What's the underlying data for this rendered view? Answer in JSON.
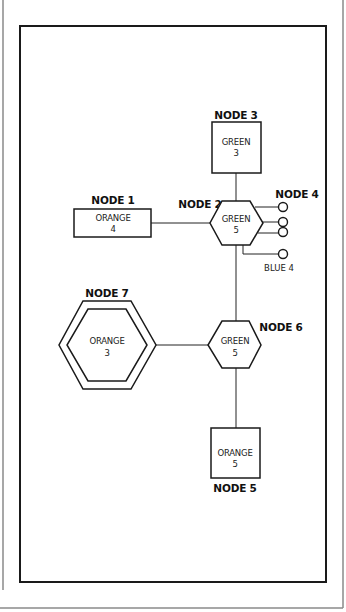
{
  "diagram": {
    "nodes": [
      {
        "id": "node-1",
        "label": "NODE 1",
        "color": "ORANGE",
        "value": "4",
        "shape": "rectangle"
      },
      {
        "id": "node-2",
        "label": "NODE 2",
        "color": "GREEN",
        "value": "5",
        "shape": "hexagon"
      },
      {
        "id": "node-3",
        "label": "NODE 3",
        "color": "GREEN",
        "value": "3",
        "shape": "square"
      },
      {
        "id": "node-4",
        "label": "NODE 4",
        "ports": 3,
        "shape": "circles"
      },
      {
        "id": "node-5",
        "label": "NODE 5",
        "color": "ORANGE",
        "value": "5",
        "shape": "square"
      },
      {
        "id": "node-6",
        "label": "NODE 6",
        "color": "GREEN",
        "value": "5",
        "shape": "hexagon"
      },
      {
        "id": "node-7",
        "label": "NODE 7",
        "color": "ORANGE",
        "value": "3",
        "shape": "double-hexagon"
      }
    ],
    "blue_port": {
      "label": "BLUE 4"
    },
    "edges": [
      [
        "node-1",
        "node-2"
      ],
      [
        "node-3",
        "node-2"
      ],
      [
        "node-2",
        "node-4"
      ],
      [
        "node-2",
        "blue-4"
      ],
      [
        "node-2",
        "node-6"
      ],
      [
        "node-7",
        "node-6"
      ],
      [
        "node-6",
        "node-5"
      ]
    ]
  }
}
